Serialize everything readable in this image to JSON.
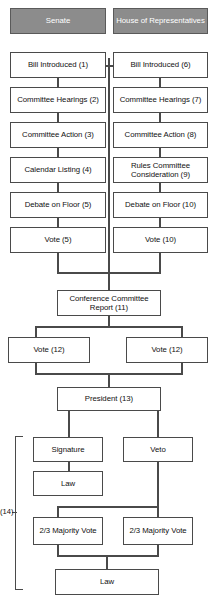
{
  "diagram": {
    "columns": {
      "left": "Senate",
      "right": "House of Representatives"
    },
    "annotation": "(14)",
    "nodes": {
      "senate_header": "Senate",
      "house_header": "House of Representatives",
      "s1": "Bill Introduced (1)",
      "s2": "Committee Hearings (2)",
      "s3": "Committee Action (3)",
      "s4": "Calendar Listing (4)",
      "s5": "Debate on Floor (5)",
      "s6": "Vote (5)",
      "h1": "Bill Introduced (6)",
      "h2": "Committee Hearings (7)",
      "h3": "Committee Action (8)",
      "h4": "Rules Committee Consideration (9)",
      "h5": "Debate on Floor (10)",
      "h6": "Vote (10)",
      "conference": "Conference Committee Report (11)",
      "vote_left": "Vote (12)",
      "vote_right": "Vote (12)",
      "president": "President (13)",
      "signature": "Signature",
      "law_after_signature": "Law",
      "veto": "Veto",
      "majority_left": "2/3 Majority Vote",
      "majority_right": "2/3 Majority Vote",
      "law_final": "Law"
    },
    "colors": {
      "header_fill": "#8c8c8c",
      "header_text": "#ffffff",
      "box_fill": "#ffffff",
      "box_border": "#4a4a4a",
      "connector": "#4a4a4a",
      "text": "#111111"
    }
  }
}
